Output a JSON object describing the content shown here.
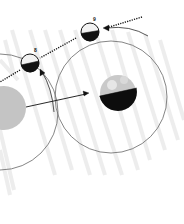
{
  "diagram": {
    "colors": {
      "ray": "#eeeeee",
      "orbit": "#555555",
      "dark_side": "#111111",
      "earth": "#bdbdbd"
    },
    "moons": [
      {
        "label": "8",
        "cx": 35,
        "cy": 63
      },
      {
        "label": "9",
        "cx": 90,
        "cy": 32
      }
    ],
    "earths": [
      {
        "name": "earth-right",
        "cx": 118,
        "cy": 93
      },
      {
        "name": "earth-left",
        "cx": 4,
        "cy": 108
      }
    ]
  }
}
